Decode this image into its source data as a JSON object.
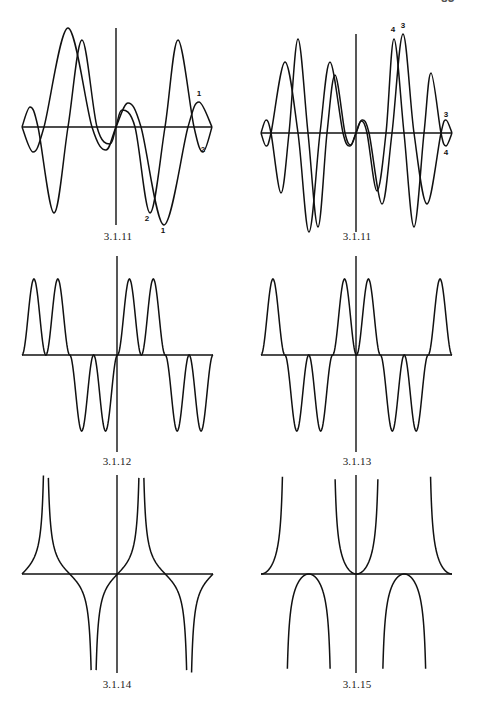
{
  "page": {
    "number": "83"
  },
  "style": {
    "ink": "#111111",
    "background": "#ffffff",
    "axis_width": 1.4,
    "curve_width": 1.5
  },
  "chart_data": [
    {
      "id": "fig-3-1-11-a",
      "type": "line",
      "title": "3.1.11",
      "caption_pos": [
        118,
        240
      ],
      "frame": {
        "x_min": 22,
        "x_max": 212,
        "axis_y": 127,
        "origin_x": 116,
        "vaxis_top": 28,
        "vaxis_bottom": 225
      },
      "series": [
        {
          "name": "1",
          "points": [
            [
              22,
              127
            ],
            [
              33,
              152
            ],
            [
              44,
              127
            ],
            [
              68,
              28
            ],
            [
              92,
              127
            ],
            [
              106,
              150
            ],
            [
              116,
              127
            ],
            [
              128,
              103
            ],
            [
              141,
              127
            ],
            [
              164,
              225
            ],
            [
              188,
              127
            ],
            [
              199,
              102
            ],
            [
              212,
              127
            ]
          ]
        },
        {
          "name": "2",
          "points": [
            [
              22,
              127
            ],
            [
              30,
              107
            ],
            [
              38,
              127
            ],
            [
              54,
              213
            ],
            [
              68,
              127
            ],
            [
              82,
              40
            ],
            [
              97,
              127
            ],
            [
              110,
              144
            ],
            [
              116,
              127
            ],
            [
              122,
              110
            ],
            [
              135,
              127
            ],
            [
              150,
              213
            ],
            [
              165,
              127
            ],
            [
              178,
              40
            ],
            [
              194,
              127
            ],
            [
              203,
              152
            ],
            [
              212,
              127
            ]
          ]
        }
      ],
      "annotations": [
        {
          "text": "1",
          "x": 199,
          "y": 96
        },
        {
          "text": "2",
          "x": 203,
          "y": 152
        },
        {
          "text": "2",
          "x": 147,
          "y": 221
        },
        {
          "text": "1",
          "x": 163,
          "y": 233
        }
      ],
      "xlabel": "",
      "ylabel": "",
      "grid": false
    },
    {
      "id": "fig-3-1-11-b",
      "type": "line",
      "title": "3.1.11",
      "caption_pos": [
        357,
        240
      ],
      "frame": {
        "x_min": 261,
        "x_max": 452,
        "axis_y": 133,
        "origin_x": 356,
        "vaxis_top": 34,
        "vaxis_bottom": 232
      },
      "series": [
        {
          "name": "3",
          "points": [
            [
              261,
              133
            ],
            [
              266,
              146
            ],
            [
              271,
              133
            ],
            [
              285,
              62
            ],
            [
              298,
              133
            ],
            [
              309,
              232
            ],
            [
              320,
              133
            ],
            [
              330,
              62
            ],
            [
              343,
              133
            ],
            [
              350,
              146
            ],
            [
              356,
              133
            ],
            [
              362,
              120
            ],
            [
              369,
              133
            ],
            [
              382,
              204
            ],
            [
              392,
              133
            ],
            [
              403,
              34
            ],
            [
              414,
              133
            ],
            [
              427,
              204
            ],
            [
              441,
              133
            ],
            [
              446,
              120
            ],
            [
              452,
              133
            ]
          ]
        },
        {
          "name": "4",
          "points": [
            [
              261,
              133
            ],
            [
              266,
              120
            ],
            [
              271,
              133
            ],
            [
              281,
              193
            ],
            [
              289,
              133
            ],
            [
              298,
              39
            ],
            [
              308,
              133
            ],
            [
              318,
              227
            ],
            [
              327,
              133
            ],
            [
              335,
              75
            ],
            [
              345,
              133
            ],
            [
              351,
              145
            ],
            [
              356,
              133
            ],
            [
              361,
              121
            ],
            [
              367,
              133
            ],
            [
              377,
              191
            ],
            [
              386,
              133
            ],
            [
              394,
              39
            ],
            [
              404,
              133
            ],
            [
              414,
              227
            ],
            [
              424,
              133
            ],
            [
              431,
              73
            ],
            [
              441,
              133
            ],
            [
              446,
              146
            ],
            [
              452,
              133
            ]
          ]
        }
      ],
      "annotations": [
        {
          "text": "4",
          "x": 393,
          "y": 32
        },
        {
          "text": "3",
          "x": 403,
          "y": 28
        },
        {
          "text": "3",
          "x": 446,
          "y": 117
        },
        {
          "text": "4",
          "x": 446,
          "y": 155
        }
      ],
      "xlabel": "",
      "ylabel": "",
      "grid": false
    },
    {
      "id": "fig-3-1-12",
      "type": "line",
      "title": "3.1.12",
      "caption_pos": [
        117,
        465
      ],
      "frame": {
        "x_min": 22,
        "x_max": 213,
        "axis_y": 355,
        "origin_x": 117,
        "vaxis_top": 256,
        "vaxis_bottom": 452,
        "amplitude": 76
      },
      "function": "sign(sin x) * sin^2(2x)",
      "x_domain": [
        -6.2832,
        6.2832
      ],
      "y_range": [
        -1,
        1
      ],
      "xlabel": "",
      "ylabel": "",
      "grid": false
    },
    {
      "id": "fig-3-1-13",
      "type": "line",
      "title": "3.1.13",
      "caption_pos": [
        357,
        465
      ],
      "frame": {
        "x_min": 261,
        "x_max": 452,
        "axis_y": 355,
        "origin_x": 356,
        "vaxis_top": 256,
        "vaxis_bottom": 452,
        "amplitude": 76
      },
      "function": "sign(cos x) * sin^2(2x)",
      "x_domain": [
        -6.2832,
        6.2832
      ],
      "y_range": [
        -1,
        1
      ],
      "xlabel": "",
      "ylabel": "",
      "grid": false
    },
    {
      "id": "fig-3-1-14",
      "type": "line",
      "title": "3.1.14",
      "caption_pos": [
        117,
        688
      ],
      "frame": {
        "x_min": 22,
        "x_max": 213,
        "axis_y": 574,
        "origin_x": 117,
        "vaxis_top": 475,
        "vaxis_bottom": 673,
        "amplitude": 16,
        "clip_top": 475,
        "clip_bottom": 673
      },
      "function": "sin x / |cos x|",
      "x_domain": [
        -6.2832,
        6.2832
      ],
      "asymptotes": [
        -4.7124,
        -1.5708,
        1.5708,
        4.7124
      ],
      "xlabel": "",
      "ylabel": "",
      "grid": false
    },
    {
      "id": "fig-3-1-15",
      "type": "line",
      "title": "3.1.15",
      "caption_pos": [
        357,
        688
      ],
      "frame": {
        "x_min": 261,
        "x_max": 452,
        "axis_y": 574,
        "origin_x": 356,
        "vaxis_top": 475,
        "vaxis_bottom": 673,
        "amplitude": 16,
        "clip_top": 475,
        "clip_bottom": 673
      },
      "function": "sin^2 x / cos x",
      "x_domain": [
        -6.2832,
        6.2832
      ],
      "asymptotes": [
        -4.7124,
        -1.5708,
        1.5708,
        4.7124
      ],
      "xlabel": "",
      "ylabel": "",
      "grid": false
    }
  ]
}
